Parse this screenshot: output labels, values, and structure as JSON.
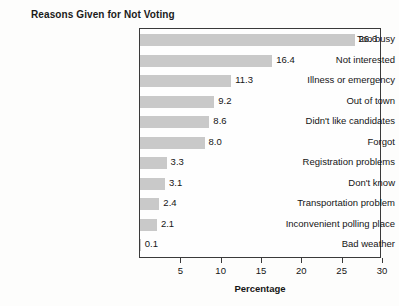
{
  "chart_data": {
    "type": "bar",
    "orientation": "horizontal",
    "title": "Reasons Given for Not Voting",
    "xlabel": "Percentage",
    "ylabel": "",
    "xlim": [
      0,
      30
    ],
    "xticks": [
      5,
      10,
      15,
      20,
      25,
      30
    ],
    "grid": false,
    "legend": null,
    "bar_color": "#c9c9c9",
    "categories": [
      "Too busy",
      "Not interested",
      "Illness or emergency",
      "Out of town",
      "Didn't like candidates",
      "Forgot",
      "Registration problems",
      "Don't know",
      "Transportation problem",
      "Inconvenient polling place",
      "Bad weather"
    ],
    "values": [
      26.6,
      16.4,
      11.3,
      9.2,
      8.6,
      8.0,
      3.3,
      3.1,
      2.4,
      2.1,
      0.1
    ],
    "value_labels": [
      "26.6",
      "16.4",
      "11.3",
      "9.2",
      "8.6",
      "8.0",
      "3.3",
      "3.1",
      "2.4",
      "2.1",
      "0.1"
    ],
    "tick_labels": [
      "5",
      "10",
      "15",
      "20",
      "25",
      "30"
    ]
  }
}
